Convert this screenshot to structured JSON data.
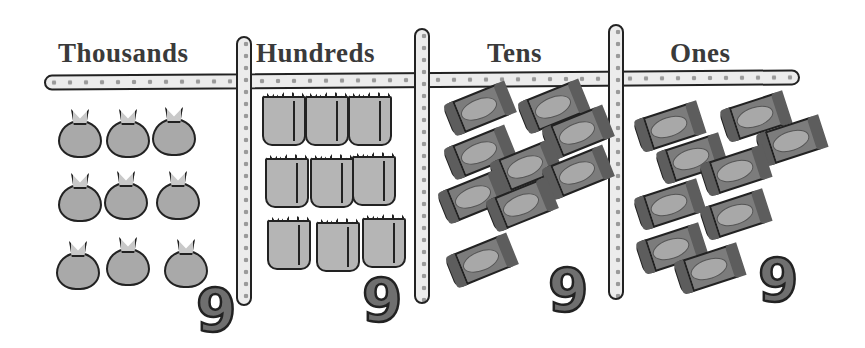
{
  "place_value_chart": {
    "columns": [
      {
        "label": "Thousands",
        "item": "money-sack",
        "count": 9,
        "digit": "9"
      },
      {
        "label": "Hundreds",
        "item": "paper-bag",
        "count": 9,
        "digit": "9"
      },
      {
        "label": "Tens",
        "item": "candy-bar",
        "count": 9,
        "digit": "9"
      },
      {
        "label": "Ones",
        "item": "candy-bar",
        "count": 9,
        "digit": "9"
      }
    ],
    "number_represented": "9999"
  }
}
